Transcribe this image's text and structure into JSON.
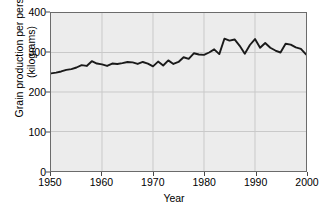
{
  "chart_data": {
    "type": "line",
    "title": "",
    "xlabel": "Year",
    "ylabel": "Grain production per person (kilograms)",
    "ylabel_line1": "Grain production per person",
    "ylabel_line2": "(kilograms)",
    "xlim": [
      1950,
      2000
    ],
    "ylim": [
      0,
      400
    ],
    "xticks": [
      1950,
      1960,
      1970,
      1980,
      1990,
      2000
    ],
    "yticks": [
      0,
      100,
      200,
      300,
      400
    ],
    "grid": true,
    "legend": "none",
    "line_color": "#1a1a1a",
    "plot_background": "#ececec",
    "grid_color": "#c9c9c9",
    "frame_color": "#6b6b6b",
    "series": [
      {
        "name": "Grain production per person",
        "x": [
          1950,
          1951,
          1952,
          1953,
          1954,
          1955,
          1956,
          1957,
          1958,
          1959,
          1960,
          1961,
          1962,
          1963,
          1964,
          1965,
          1966,
          1967,
          1968,
          1969,
          1970,
          1971,
          1972,
          1973,
          1974,
          1975,
          1976,
          1977,
          1978,
          1979,
          1980,
          1981,
          1982,
          1983,
          1984,
          1985,
          1986,
          1987,
          1988,
          1989,
          1990,
          1991,
          1992,
          1993,
          1994,
          1995,
          1996,
          1997,
          1998,
          1999,
          2000
        ],
        "values": [
          247,
          249,
          252,
          256,
          258,
          262,
          268,
          266,
          278,
          272,
          270,
          266,
          272,
          271,
          273,
          276,
          275,
          271,
          276,
          272,
          265,
          277,
          267,
          280,
          271,
          276,
          288,
          284,
          298,
          295,
          294,
          300,
          308,
          296,
          335,
          330,
          333,
          317,
          297,
          319,
          334,
          312,
          324,
          312,
          305,
          300,
          322,
          320,
          313,
          309,
          295
        ]
      }
    ]
  }
}
